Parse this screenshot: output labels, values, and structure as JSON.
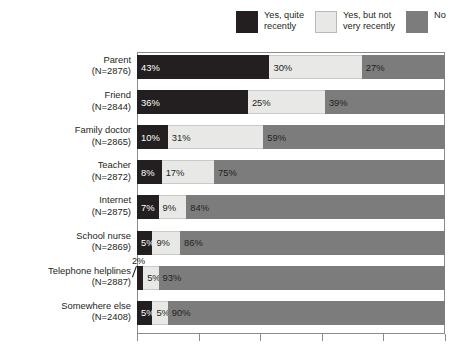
{
  "legend": {
    "items": [
      {
        "label": "Yes, quite\nrecently",
        "color": "#231f20",
        "name": "yes-quite-recently"
      },
      {
        "label": "Yes, but not\nvery recently",
        "color": "#e8e8e6",
        "name": "yes-but-not-very-recently"
      },
      {
        "label": "No",
        "color": "#7c7c7c",
        "name": "no"
      }
    ]
  },
  "chart_data": {
    "type": "bar",
    "orientation": "horizontal",
    "stacked": true,
    "title": "",
    "xlabel": "",
    "ylabel": "",
    "xlim": [
      0,
      100
    ],
    "xticks": [
      0,
      20,
      40,
      60,
      80,
      100
    ],
    "grid": false,
    "legend_position": "top-right",
    "categories": [
      "Parent",
      "Friend",
      "Family doctor",
      "Teacher",
      "Internet",
      "School nurse",
      "Telephone helplines",
      "Somewhere else"
    ],
    "category_counts": [
      "(N=2876)",
      "(N=2844)",
      "(N=2865)",
      "(N=2872)",
      "(N=2875)",
      "(N=2869)",
      "(N=2887)",
      "(N=2408)"
    ],
    "series": [
      {
        "name": "Yes, quite recently",
        "color": "#231f20",
        "values": [
          43,
          36,
          10,
          8,
          7,
          5,
          2,
          5
        ]
      },
      {
        "name": "Yes, but not very recently",
        "color": "#e8e8e6",
        "values": [
          30,
          25,
          31,
          17,
          9,
          9,
          5,
          5
        ]
      },
      {
        "name": "No",
        "color": "#7c7c7c",
        "values": [
          27,
          39,
          59,
          75,
          84,
          86,
          93,
          90
        ]
      }
    ],
    "value_labels": [
      [
        "43%",
        "30%",
        "27%"
      ],
      [
        "36%",
        "25%",
        "39%"
      ],
      [
        "10%",
        "31%",
        "59%"
      ],
      [
        "8%",
        "17%",
        "75%"
      ],
      [
        "7%",
        "9%",
        "84%"
      ],
      [
        "5%",
        "9%",
        "86%"
      ],
      [
        "2%",
        "5%",
        "93%"
      ],
      [
        "5%",
        "5%",
        "90%"
      ]
    ]
  },
  "callout": {
    "label": "2%"
  }
}
